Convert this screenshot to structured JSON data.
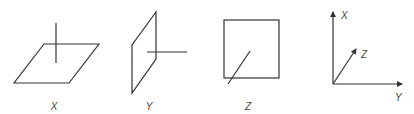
{
  "diagram": {
    "panels": [
      {
        "id": "x",
        "label": "X",
        "shape": "horizontal-plane",
        "normal": "vertical-line"
      },
      {
        "id": "y",
        "label": "Y",
        "shape": "vertical-plane-side",
        "normal": "horizontal-line"
      },
      {
        "id": "z",
        "label": "Z",
        "shape": "square-front",
        "normal": "diagonal-line"
      }
    ],
    "axes": {
      "x_label": "X",
      "y_label": "Y",
      "z_label": "Z"
    },
    "colors": {
      "stroke": "#333333",
      "text": "#444444",
      "background": "#ffffff"
    }
  }
}
